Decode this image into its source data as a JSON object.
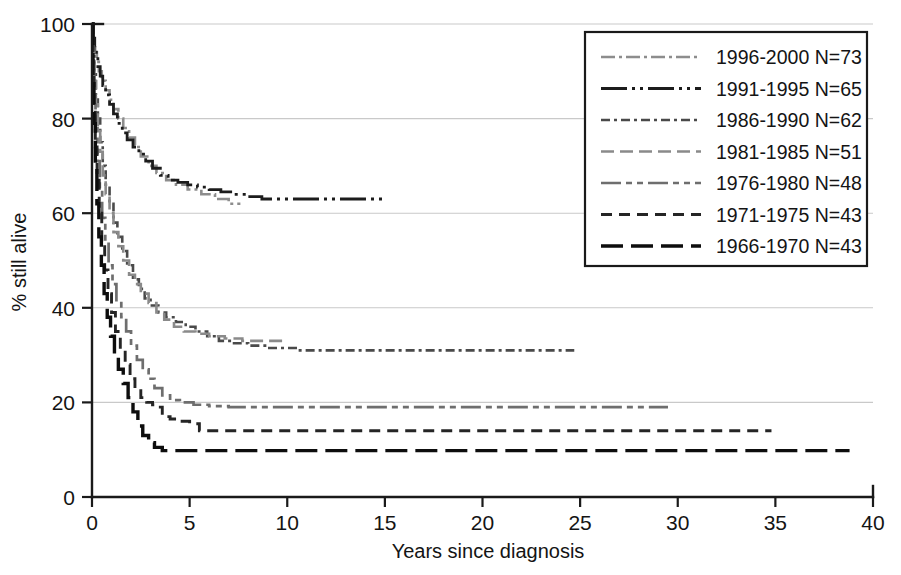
{
  "chart_data": {
    "type": "line",
    "title": "",
    "xlabel": "Years since diagnosis",
    "ylabel": "% still alive",
    "xlim": [
      0,
      40
    ],
    "ylim": [
      0,
      100
    ],
    "xticks": [
      0,
      5,
      10,
      15,
      20,
      25,
      30,
      35,
      40
    ],
    "yticks": [
      0,
      20,
      40,
      60,
      80,
      100
    ],
    "grid": "horizontal",
    "legend_position": "top-right",
    "series": [
      {
        "name": "1996-2000 N=73",
        "label": "1996-2000 N=73",
        "color": "#8d8d8d",
        "dash": "14,4,3,4",
        "width": 2.6,
        "n": 73,
        "plateau": 62,
        "x_end": 7.6,
        "points": [
          [
            0,
            100
          ],
          [
            0.08,
            96
          ],
          [
            0.16,
            94
          ],
          [
            0.25,
            92
          ],
          [
            0.35,
            90
          ],
          [
            0.5,
            88
          ],
          [
            0.7,
            86
          ],
          [
            0.9,
            84
          ],
          [
            1.1,
            82
          ],
          [
            1.35,
            80
          ],
          [
            1.6,
            78
          ],
          [
            1.9,
            76
          ],
          [
            2.2,
            74
          ],
          [
            2.5,
            72
          ],
          [
            2.9,
            70
          ],
          [
            3.3,
            68.5
          ],
          [
            3.8,
            67
          ],
          [
            4.3,
            66
          ],
          [
            4.9,
            65
          ],
          [
            5.6,
            64
          ],
          [
            6.3,
            63
          ],
          [
            7.0,
            62
          ],
          [
            7.6,
            62
          ]
        ]
      },
      {
        "name": "1991-1995 N=65",
        "label": "1991-1995 N=65",
        "color": "#1c1c1c",
        "dash": "26,5,3,5,3,5",
        "width": 2.8,
        "n": 65,
        "plateau": 63,
        "x_end": 15.0,
        "points": [
          [
            0,
            100
          ],
          [
            0.07,
            97
          ],
          [
            0.14,
            95
          ],
          [
            0.22,
            93
          ],
          [
            0.3,
            91
          ],
          [
            0.42,
            89
          ],
          [
            0.55,
            87
          ],
          [
            0.7,
            85
          ],
          [
            0.9,
            83
          ],
          [
            1.1,
            81
          ],
          [
            1.3,
            79
          ],
          [
            1.55,
            77
          ],
          [
            1.8,
            75.5
          ],
          [
            2.1,
            74
          ],
          [
            2.4,
            72.5
          ],
          [
            2.75,
            71
          ],
          [
            3.1,
            69.5
          ],
          [
            3.5,
            68
          ],
          [
            3.9,
            67
          ],
          [
            4.4,
            66.5
          ],
          [
            4.9,
            66
          ],
          [
            5.4,
            65.5
          ],
          [
            6.0,
            65
          ],
          [
            6.6,
            64.5
          ],
          [
            7.2,
            64
          ],
          [
            7.9,
            63.5
          ],
          [
            8.7,
            63
          ],
          [
            10.0,
            63
          ],
          [
            12.0,
            63
          ],
          [
            15.0,
            63
          ]
        ]
      },
      {
        "name": "1986-1990 N=62",
        "label": "1986-1990 N=62",
        "color": "#4a4a4a",
        "dash": "9,4,3,4",
        "width": 2.6,
        "n": 62,
        "plateau": 31,
        "x_end": 24.7,
        "points": [
          [
            0,
            100
          ],
          [
            0.06,
            95
          ],
          [
            0.12,
            90
          ],
          [
            0.2,
            85
          ],
          [
            0.3,
            80
          ],
          [
            0.42,
            75
          ],
          [
            0.55,
            70
          ],
          [
            0.7,
            66
          ],
          [
            0.9,
            62
          ],
          [
            1.1,
            58
          ],
          [
            1.3,
            55
          ],
          [
            1.55,
            52
          ],
          [
            1.8,
            49
          ],
          [
            2.1,
            46
          ],
          [
            2.4,
            44
          ],
          [
            2.7,
            42
          ],
          [
            3.0,
            40.5
          ],
          [
            3.4,
            39
          ],
          [
            3.8,
            38
          ],
          [
            4.3,
            37
          ],
          [
            4.8,
            36
          ],
          [
            5.3,
            35
          ],
          [
            5.9,
            34
          ],
          [
            6.5,
            33
          ],
          [
            7.2,
            32.5
          ],
          [
            8.0,
            32
          ],
          [
            9.0,
            31.5
          ],
          [
            10.5,
            31
          ],
          [
            13.0,
            31
          ],
          [
            17.0,
            31
          ],
          [
            21.0,
            31
          ],
          [
            24.7,
            31
          ]
        ]
      },
      {
        "name": "1981-1985 N=51",
        "label": "1981-1985 N=51",
        "color": "#8a8a8a",
        "dash": "13,6",
        "width": 2.6,
        "n": 51,
        "plateau": 33,
        "x_end": 9.8,
        "points": [
          [
            0,
            100
          ],
          [
            0.06,
            94
          ],
          [
            0.12,
            88
          ],
          [
            0.2,
            83
          ],
          [
            0.3,
            78
          ],
          [
            0.42,
            73
          ],
          [
            0.55,
            68
          ],
          [
            0.7,
            64
          ],
          [
            0.9,
            60
          ],
          [
            1.1,
            56
          ],
          [
            1.35,
            53
          ],
          [
            1.6,
            50
          ],
          [
            1.9,
            47
          ],
          [
            2.2,
            45
          ],
          [
            2.5,
            43
          ],
          [
            2.9,
            41
          ],
          [
            3.3,
            39
          ],
          [
            3.7,
            37.5
          ],
          [
            4.2,
            36
          ],
          [
            4.7,
            35
          ],
          [
            5.3,
            34.5
          ],
          [
            6.0,
            34
          ],
          [
            6.8,
            33.5
          ],
          [
            7.7,
            33
          ],
          [
            8.7,
            33
          ],
          [
            9.8,
            33
          ]
        ]
      },
      {
        "name": "1976-1980 N=48",
        "label": "1976-1980 N=48",
        "color": "#6e6e6e",
        "dash": "20,5,6,5,6,5",
        "width": 2.7,
        "n": 48,
        "plateau": 19,
        "x_end": 29.5,
        "points": [
          [
            0,
            100
          ],
          [
            0.05,
            92
          ],
          [
            0.11,
            85
          ],
          [
            0.18,
            78
          ],
          [
            0.28,
            71
          ],
          [
            0.4,
            65
          ],
          [
            0.52,
            59
          ],
          [
            0.68,
            54
          ],
          [
            0.85,
            49
          ],
          [
            1.05,
            45
          ],
          [
            1.25,
            41
          ],
          [
            1.5,
            38
          ],
          [
            1.75,
            35
          ],
          [
            2.0,
            32
          ],
          [
            2.3,
            29
          ],
          [
            2.6,
            27
          ],
          [
            2.9,
            25
          ],
          [
            3.2,
            23
          ],
          [
            3.6,
            21.5
          ],
          [
            4.0,
            20.5
          ],
          [
            4.5,
            20
          ],
          [
            5.2,
            19.5
          ],
          [
            6.0,
            19.2
          ],
          [
            7.0,
            19
          ],
          [
            9.0,
            19
          ],
          [
            13.0,
            19
          ],
          [
            18.0,
            19
          ],
          [
            24.0,
            19
          ],
          [
            29.5,
            19
          ]
        ]
      },
      {
        "name": "1971-1975 N=43",
        "label": "1971-1975 N=43",
        "color": "#252525",
        "dash": "11,7",
        "width": 2.9,
        "n": 43,
        "plateau": 14,
        "x_end": 34.8,
        "points": [
          [
            0,
            100
          ],
          [
            0.05,
            90
          ],
          [
            0.1,
            82
          ],
          [
            0.17,
            74
          ],
          [
            0.26,
            67
          ],
          [
            0.37,
            60
          ],
          [
            0.5,
            54
          ],
          [
            0.65,
            48
          ],
          [
            0.82,
            43
          ],
          [
            1.0,
            39
          ],
          [
            1.2,
            35
          ],
          [
            1.45,
            31
          ],
          [
            1.7,
            28
          ],
          [
            1.95,
            25
          ],
          [
            2.2,
            23
          ],
          [
            2.5,
            21
          ],
          [
            2.8,
            20
          ],
          [
            3.1,
            19.5
          ],
          [
            3.4,
            19
          ],
          [
            3.6,
            17
          ],
          [
            4.0,
            16.5
          ],
          [
            4.5,
            16
          ],
          [
            5.0,
            15.5
          ],
          [
            5.5,
            14
          ],
          [
            6.5,
            14
          ],
          [
            10.0,
            14
          ],
          [
            16.0,
            14
          ],
          [
            24.0,
            14
          ],
          [
            30.0,
            14
          ],
          [
            34.8,
            14
          ]
        ]
      },
      {
        "name": "1966-1970 N=43",
        "label": "1966-1970 N=43",
        "color": "#0d0d0d",
        "dash": "22,8",
        "width": 3.4,
        "n": 43,
        "plateau": 9.8,
        "x_end": 38.8,
        "points": [
          [
            0,
            100
          ],
          [
            0.05,
            88
          ],
          [
            0.1,
            79
          ],
          [
            0.17,
            70
          ],
          [
            0.25,
            62
          ],
          [
            0.35,
            55
          ],
          [
            0.48,
            49
          ],
          [
            0.62,
            43
          ],
          [
            0.78,
            38
          ],
          [
            0.95,
            34
          ],
          [
            1.15,
            30
          ],
          [
            1.35,
            27
          ],
          [
            1.6,
            24
          ],
          [
            1.85,
            21
          ],
          [
            2.1,
            18
          ],
          [
            2.35,
            15
          ],
          [
            2.6,
            13
          ],
          [
            2.9,
            11.5
          ],
          [
            3.2,
            10.5
          ],
          [
            3.6,
            9.8
          ],
          [
            5.0,
            9.8
          ],
          [
            9.0,
            9.8
          ],
          [
            15.0,
            9.8
          ],
          [
            22.0,
            9.8
          ],
          [
            30.0,
            9.8
          ],
          [
            38.8,
            9.8
          ]
        ]
      }
    ]
  },
  "axes": {
    "x_title": "Years since diagnosis",
    "y_title": "% still alive",
    "x_tick_labels": [
      "0",
      "5",
      "10",
      "15",
      "20",
      "25",
      "30",
      "35",
      "40"
    ],
    "y_tick_labels": [
      "0",
      "20",
      "40",
      "60",
      "80",
      "100"
    ]
  },
  "legend": {
    "items": [
      "1996-2000 N=73",
      "1991-1995 N=65",
      "1986-1990 N=62",
      "1981-1985 N=51",
      "1976-1980 N=48",
      "1971-1975 N=43",
      "1966-1970 N=43"
    ]
  },
  "colors": {
    "axis": "#1a1a1a",
    "grid": "#c9c9c9",
    "background": "#ffffff"
  }
}
